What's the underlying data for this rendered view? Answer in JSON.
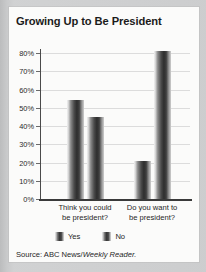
{
  "card": {
    "title": "Growing Up to Be President",
    "source_prefix": "Source: ABC News/",
    "source_italic": "Weekly Reader."
  },
  "legend": {
    "items": [
      {
        "label": "Yes",
        "swatch": "bar-swatch-icon"
      },
      {
        "label": "No",
        "swatch": "bar-swatch-icon"
      }
    ]
  },
  "axis": {
    "y_ticks": [
      "80%",
      "70%",
      "60%",
      "50%",
      "40%",
      "30%",
      "20%",
      "10%",
      "0%"
    ]
  },
  "categories_display": [
    {
      "line1": "Think you could",
      "line2": "be president?"
    },
    {
      "line1": "Do you want to",
      "line2": "be president?"
    }
  ],
  "chart_data": {
    "type": "bar",
    "title": "Growing Up to Be President",
    "subtitle": "",
    "xlabel": "",
    "ylabel": "",
    "ylim": [
      0,
      80
    ],
    "ytick_values": [
      0,
      10,
      20,
      30,
      40,
      50,
      60,
      70,
      80
    ],
    "ytick_labels": [
      "0%",
      "10%",
      "20%",
      "30%",
      "40%",
      "50%",
      "60%",
      "70%",
      "80%"
    ],
    "grid": true,
    "grid_axis": "y",
    "legend_position": "bottom-left",
    "value_unit": "percent",
    "categories": [
      "Think you could be president?",
      "Do you want to be president?"
    ],
    "series": [
      {
        "name": "Yes",
        "values": [
          54,
          21
        ]
      },
      {
        "name": "No",
        "values": [
          45,
          81
        ]
      }
    ],
    "source": "Source: ABC News/Weekly Reader."
  }
}
